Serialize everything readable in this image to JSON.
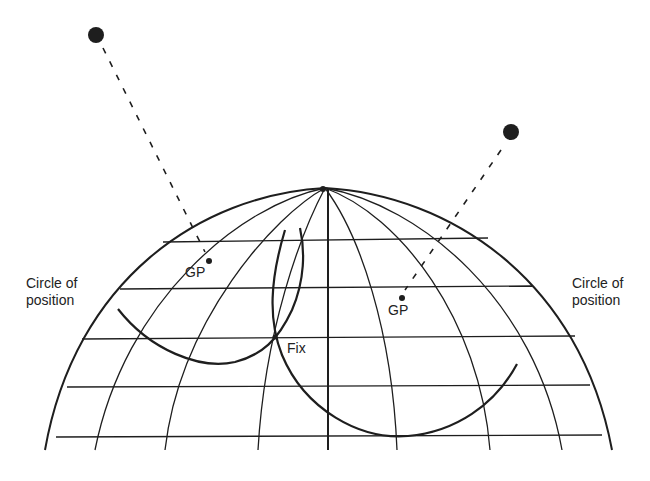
{
  "diagram": {
    "type": "celestial navigation fix diagram",
    "colors": {
      "ink": "#1e1e1e",
      "background": "#ffffff"
    },
    "labels": {
      "left_circle": "Circle of\nposition",
      "right_circle": "Circle of\nposition",
      "left_gp": "GP",
      "right_gp": "GP",
      "fix": "Fix"
    },
    "elements": {
      "left_star": "celestial body (left)",
      "right_star": "celestial body (right)",
      "pole": "north pole",
      "globe": "hemisphere with meridians and parallels"
    }
  }
}
